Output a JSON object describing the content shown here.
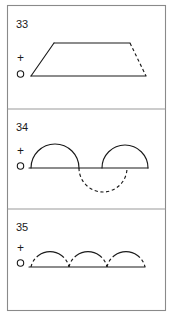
{
  "sheet": {
    "title": "Waveform figures 33-35",
    "background_color": "#ffffff",
    "ink_color": "#1a1a1a",
    "frame_color": "#8a8a8a"
  },
  "panels": [
    {
      "number": "33",
      "polarity_plus": "+",
      "polarity_zero": "o",
      "figure": "trapezoid-pulse",
      "description": "Trapezoidal waveform: ramp up, flat top, dashed ramp down, flat baseline"
    },
    {
      "number": "34",
      "polarity_plus": "+",
      "polarity_zero": "o",
      "figure": "half-sine-alternating",
      "description": "Baseline with solid positive half-arc, dashed negative half-arc, solid positive half-arc"
    },
    {
      "number": "35",
      "polarity_plus": "+",
      "polarity_zero": "o",
      "figure": "three-half-arcs",
      "description": "Baseline with three positive half-arcs, dashed at rising and falling ends, solid at crests"
    }
  ]
}
